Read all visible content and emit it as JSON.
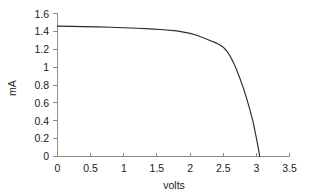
{
  "chart_data": {
    "type": "line",
    "title": "",
    "xlabel": "volts",
    "ylabel": "mA",
    "xlim": [
      0,
      3.5
    ],
    "ylim": [
      0,
      1.6
    ],
    "grid": false,
    "legend": "none",
    "xticks": [
      "0",
      "0.5",
      "1",
      "1.5",
      "2",
      "2.5",
      "3",
      "3.5"
    ],
    "xtick_values": [
      0,
      0.5,
      1,
      1.5,
      2,
      2.5,
      3,
      3.5
    ],
    "yticks": [
      "0",
      "0.2",
      "0.4",
      "0.6",
      "0.8",
      "1",
      "1.2",
      "1.4",
      "1.6"
    ],
    "ytick_values": [
      0,
      0.2,
      0.4,
      0.6,
      0.8,
      1.0,
      1.2,
      1.4,
      1.6
    ],
    "series": [
      {
        "name": "I-V curve",
        "color": "#2b2b2b",
        "x": [
          0.0,
          0.2,
          0.4,
          0.6,
          0.8,
          1.0,
          1.2,
          1.4,
          1.6,
          1.8,
          2.0,
          2.1,
          2.2,
          2.3,
          2.4,
          2.45,
          2.5,
          2.55,
          2.6,
          2.65,
          2.7,
          2.75,
          2.8,
          2.85,
          2.9,
          2.95,
          3.0,
          3.03,
          3.05
        ],
        "y": [
          1.46,
          1.458,
          1.455,
          1.452,
          1.448,
          1.443,
          1.437,
          1.43,
          1.42,
          1.408,
          1.38,
          1.358,
          1.33,
          1.3,
          1.27,
          1.25,
          1.225,
          1.185,
          1.13,
          1.06,
          0.975,
          0.88,
          0.775,
          0.66,
          0.53,
          0.39,
          0.21,
          0.09,
          0.0
        ]
      }
    ]
  },
  "labels": {
    "x_axis_title": "volts",
    "y_axis_title": "mA"
  }
}
